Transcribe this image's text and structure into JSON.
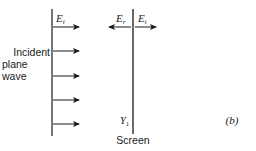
{
  "figure": {
    "panel_label": "(b)",
    "incident": {
      "field_label": "E",
      "field_subscript": "i",
      "text_lines": [
        "Incident",
        "plane",
        "wave"
      ],
      "arrow_count": 5
    },
    "screen": {
      "reflected_label": "E",
      "reflected_subscript": "r",
      "transmitted_label": "E",
      "transmitted_subscript": "t",
      "admittance_label": "Y",
      "admittance_subscript": "1",
      "caption": "Screen"
    },
    "colors": {
      "line": "#1a1a1a",
      "text": "#1a1a1a",
      "background": "#ffffff"
    }
  }
}
